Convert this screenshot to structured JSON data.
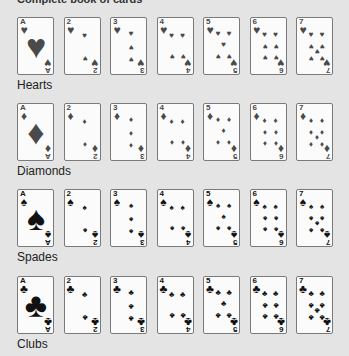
{
  "title": "Complete book of cards",
  "colors": {
    "background": "#e4e4e4",
    "card": "#fbfbfb",
    "card_border": "#7a7a7a",
    "red_suit": "#4a4a4a",
    "black_suit": "#111111"
  },
  "rows": [
    {
      "label": "Hearts",
      "suit": "heart-icon",
      "glyph": "♥",
      "color": "#4a4a4a",
      "top": 17,
      "cards": [
        "A",
        "2",
        "3",
        "4",
        "5",
        "6",
        "7"
      ]
    },
    {
      "label": "Diamonds",
      "suit": "diamond-icon",
      "glyph": "♦",
      "color": "#4a4a4a",
      "top": 103,
      "cards": [
        "A",
        "2",
        "3",
        "4",
        "5",
        "6",
        "7"
      ]
    },
    {
      "label": "Spades",
      "suit": "spade-icon",
      "glyph": "♠",
      "color": "#111111",
      "top": 189,
      "cards": [
        "A",
        "2",
        "3",
        "4",
        "5",
        "6",
        "7"
      ]
    },
    {
      "label": "Clubs",
      "suit": "club-icon",
      "glyph": "♣",
      "color": "#111111",
      "top": 276,
      "cards": [
        "A",
        "2",
        "3",
        "4",
        "5",
        "6",
        "7"
      ]
    }
  ]
}
